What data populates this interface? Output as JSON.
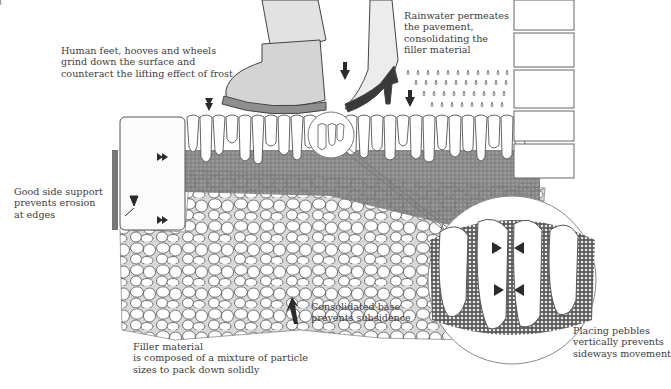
{
  "diagram": {
    "annotations": [
      {
        "id": "traffic",
        "lines": [
          "Human feet, hooves and wheels",
          "grind down the surface and",
          "counteract the lifting effect of frost"
        ]
      },
      {
        "id": "rain",
        "lines": [
          "Rainwater permeates",
          "the pavement,",
          "consolidating the",
          "filler material"
        ]
      },
      {
        "id": "side-support",
        "lines": [
          "Good side support",
          "prevents erosion",
          "at edges"
        ]
      },
      {
        "id": "base",
        "lines": [
          "Consolidated base",
          "prevents subsidence"
        ]
      },
      {
        "id": "filler",
        "lines": [
          "Filler material",
          "is composed of a mixture of particle",
          "sizes to pack down solidly"
        ]
      },
      {
        "id": "pebbles",
        "lines": [
          "Placing pebbles",
          "vertically prevents",
          "sideways movement"
        ]
      }
    ],
    "colors": {
      "ink": "#3a3a3a",
      "filler": "#8c8c8c",
      "stone": "#ffffff",
      "arrow": "#2b2b2b",
      "background": "#ffffff"
    }
  }
}
